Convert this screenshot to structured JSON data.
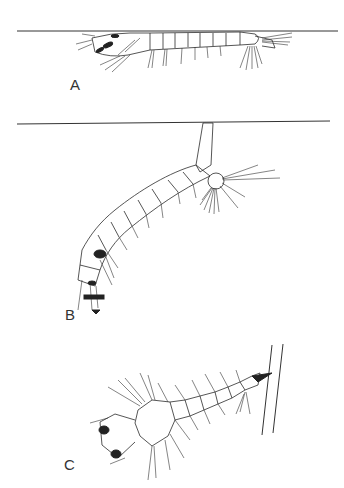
{
  "figure": {
    "panels": [
      {
        "id": "A",
        "label": "A",
        "description": "Larva lying horizontally beneath the water surface"
      },
      {
        "id": "B",
        "label": "B",
        "description": "Larva hanging at an angle from the water surface by its siphon"
      },
      {
        "id": "C",
        "label": "C",
        "description": "Larva attached to a plant stem by its siphon"
      }
    ],
    "colors": {
      "line": "#2b2b2b",
      "background": "#ffffff"
    }
  }
}
